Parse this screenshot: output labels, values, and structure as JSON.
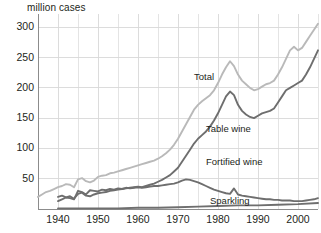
{
  "chart_data": {
    "type": "line",
    "title": "",
    "ylabel": "million cases",
    "xlabel": "",
    "xlim": [
      1935,
      2005
    ],
    "ylim": [
      0,
      322
    ],
    "grid": true,
    "legend_position": "inline-annotations",
    "yticks": [
      50,
      100,
      150,
      200,
      250,
      300
    ],
    "xticks": [
      1940,
      1950,
      1960,
      1970,
      1980,
      1990,
      2000
    ],
    "xminor_step": 5,
    "colors": {
      "total": "#b9b9b9",
      "table_wine": "#6e6e6e",
      "fortified_wine": "#6e6e6e",
      "sparkling": "#6e6e6e",
      "grid": "#d8d8d8",
      "axis": "#8c8c8c",
      "text": "#231f20"
    },
    "series": [
      {
        "name": "Total",
        "color": "#b9b9b9",
        "label_x": 1974,
        "label_y": 218,
        "x": [
          1935,
          1936,
          1937,
          1938,
          1939,
          1940,
          1941,
          1942,
          1943,
          1944,
          1945,
          1946,
          1947,
          1948,
          1949,
          1950,
          1951,
          1952,
          1953,
          1954,
          1955,
          1956,
          1957,
          1958,
          1959,
          1960,
          1961,
          1962,
          1963,
          1964,
          1965,
          1966,
          1967,
          1968,
          1969,
          1970,
          1971,
          1972,
          1973,
          1974,
          1975,
          1976,
          1977,
          1978,
          1979,
          1980,
          1981,
          1982,
          1983,
          1984,
          1985,
          1986,
          1987,
          1988,
          1989,
          1990,
          1991,
          1992,
          1993,
          1994,
          1995,
          1996,
          1997,
          1998,
          1999,
          2000,
          2001,
          2002,
          2003,
          2004,
          2005
        ],
        "values": [
          20,
          24,
          28,
          30,
          33,
          36,
          38,
          41,
          40,
          36,
          49,
          51,
          46,
          44,
          47,
          53,
          55,
          56,
          59,
          60,
          62,
          64,
          66,
          68,
          70,
          72,
          74,
          76,
          78,
          80,
          83,
          87,
          92,
          98,
          106,
          116,
          128,
          140,
          152,
          164,
          172,
          178,
          183,
          188,
          196,
          208,
          222,
          234,
          244,
          236,
          222,
          212,
          206,
          200,
          196,
          198,
          202,
          206,
          208,
          212,
          222,
          234,
          248,
          262,
          268,
          262,
          266,
          276,
          286,
          296,
          306
        ]
      },
      {
        "name": "Table wine",
        "color": "#6e6e6e",
        "label_x": 1977,
        "label_y": 132,
        "x": [
          1940,
          1941,
          1942,
          1943,
          1944,
          1945,
          1946,
          1947,
          1948,
          1949,
          1950,
          1951,
          1952,
          1953,
          1954,
          1955,
          1956,
          1957,
          1958,
          1959,
          1960,
          1961,
          1962,
          1963,
          1964,
          1965,
          1966,
          1967,
          1968,
          1969,
          1970,
          1971,
          1972,
          1973,
          1974,
          1975,
          1976,
          1977,
          1978,
          1979,
          1980,
          1981,
          1982,
          1983,
          1984,
          1985,
          1986,
          1987,
          1988,
          1989,
          1990,
          1991,
          1992,
          1993,
          1994,
          1995,
          1996,
          1997,
          1998,
          1999,
          2000,
          2001,
          2002,
          2003,
          2004,
          2005
        ],
        "values": [
          13,
          16,
          19,
          21,
          17,
          25,
          27,
          22,
          21,
          24,
          26,
          27,
          28,
          30,
          31,
          32,
          33,
          34,
          35,
          36,
          37,
          36,
          38,
          40,
          42,
          45,
          48,
          52,
          56,
          62,
          68,
          78,
          88,
          98,
          108,
          116,
          122,
          128,
          136,
          146,
          158,
          172,
          186,
          194,
          188,
          172,
          162,
          156,
          152,
          150,
          154,
          158,
          160,
          162,
          166,
          176,
          186,
          196,
          200,
          204,
          208,
          212,
          222,
          234,
          248,
          262
        ]
      },
      {
        "name": "Fortified wine",
        "color": "#6e6e6e",
        "label_x": 1977,
        "label_y": 78,
        "x": [
          1940,
          1941,
          1942,
          1943,
          1944,
          1945,
          1946,
          1947,
          1948,
          1949,
          1950,
          1951,
          1952,
          1953,
          1954,
          1955,
          1956,
          1957,
          1958,
          1959,
          1960,
          1961,
          1962,
          1963,
          1964,
          1965,
          1966,
          1967,
          1968,
          1969,
          1970,
          1971,
          1972,
          1973,
          1974,
          1975,
          1976,
          1977,
          1978,
          1979,
          1980,
          1981,
          1982,
          1983,
          1984,
          1985,
          1986,
          1987,
          1988,
          1989,
          1990,
          1991,
          1992,
          1993,
          1994,
          1995,
          1996,
          1997,
          1998,
          1999,
          2000,
          2001,
          2002,
          2003,
          2004,
          2005
        ],
        "values": [
          20,
          22,
          19,
          18,
          16,
          30,
          28,
          24,
          31,
          30,
          29,
          32,
          31,
          33,
          32,
          34,
          33,
          35,
          34,
          35,
          36,
          35,
          36,
          37,
          38,
          38,
          39,
          40,
          41,
          42,
          44,
          47,
          49,
          48,
          46,
          44,
          41,
          38,
          35,
          32,
          30,
          28,
          26,
          25,
          34,
          24,
          22,
          21,
          20,
          19,
          18,
          17,
          16,
          16,
          15,
          15,
          14,
          14,
          14,
          13,
          13,
          13,
          14,
          15,
          16,
          18
        ]
      },
      {
        "name": "Sparkling",
        "color": "#6e6e6e",
        "label_x": 1978,
        "label_y": 14,
        "x": [
          1940,
          1945,
          1950,
          1955,
          1960,
          1965,
          1970,
          1975,
          1980,
          1985,
          1990,
          1995,
          2000,
          2005
        ],
        "values": [
          1,
          1,
          1,
          1,
          2,
          2,
          3,
          4,
          5,
          6,
          6,
          7,
          8,
          10
        ]
      }
    ]
  },
  "axis": {
    "ylabel_text": "million cases",
    "ytick_labels": [
      "300",
      "250",
      "200",
      "150",
      "100",
      "50"
    ],
    "xtick_labels": [
      "1940",
      "1950",
      "1960",
      "1970",
      "1980",
      "1990",
      "2000"
    ]
  },
  "annotations": {
    "total": "Total",
    "table_wine": "Table wine",
    "fortified_wine": "Fortified wine",
    "sparkling": "Sparkling"
  }
}
